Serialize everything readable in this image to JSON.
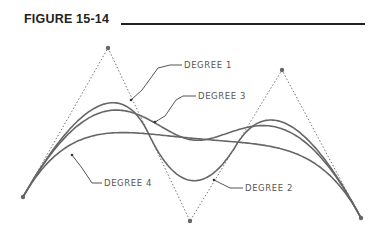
{
  "figure": {
    "title": "FIGURE 15-14"
  },
  "diagram": {
    "control_points": [
      [
        23,
        197
      ],
      [
        108,
        48
      ],
      [
        190,
        221
      ],
      [
        282,
        70
      ],
      [
        361,
        218
      ]
    ],
    "labels": [
      {
        "text": "DEGREE 1",
        "x": 184,
        "y": 68,
        "leader": [
          [
            182,
            65
          ],
          [
            170,
            65
          ],
          [
            158,
            68
          ],
          [
            142,
            90
          ],
          [
            131,
            100
          ]
        ]
      },
      {
        "text": "DEGREE 3",
        "x": 198,
        "y": 99,
        "leader": [
          [
            196,
            96
          ],
          [
            183,
            96
          ],
          [
            176,
            100
          ],
          [
            165,
            116
          ],
          [
            155,
            122
          ]
        ]
      },
      {
        "text": "DEGREE 4",
        "x": 104,
        "y": 186,
        "leader": [
          [
            102,
            183
          ],
          [
            92,
            183
          ],
          [
            82,
            168
          ],
          [
            72,
            155
          ]
        ]
      },
      {
        "text": "DEGREE 2",
        "x": 245,
        "y": 191,
        "leader": [
          [
            243,
            188
          ],
          [
            230,
            188
          ],
          [
            214,
            180
          ]
        ]
      }
    ],
    "colors": {
      "curve": "#666666",
      "polygon": "#777777",
      "point": "#666666"
    }
  }
}
